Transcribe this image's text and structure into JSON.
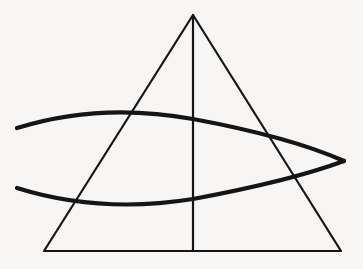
{
  "figure": {
    "type": "line-drawing",
    "background_color": "#f7f6f5",
    "ink_color": "#151515",
    "canvas": {
      "width": 363,
      "height": 269
    },
    "shapes": {
      "triangle": {
        "label": "triangle",
        "stroke_color": "#151515",
        "stroke_width": 2.2,
        "apex": {
          "x": 193,
          "y": 15
        },
        "bottom_left": {
          "x": 44,
          "y": 251
        },
        "bottom_right": {
          "x": 341,
          "y": 251
        },
        "points": "193,15 341,251 44,251"
      },
      "median_line": {
        "label": "vertical median line",
        "stroke_color": "#151515",
        "stroke_width": 2.2,
        "x1": 193,
        "y1": 15,
        "x2": 193,
        "y2": 251
      },
      "upper_arc": {
        "label": "upper arc of fish body",
        "stroke_color": "#151515",
        "stroke_width": 4.2,
        "path": "M 17 128 Q 100 102 193 119 Q 290 137 344 161",
        "start": {
          "x": 17,
          "y": 128
        },
        "end": {
          "x": 344,
          "y": 161
        },
        "apex_at_median": {
          "x": 193,
          "y": 119
        }
      },
      "lower_arc": {
        "label": "lower arc of fish body",
        "stroke_color": "#151515",
        "stroke_width": 4.2,
        "path": "M 17 188 Q 100 214 193 199 Q 290 181 344 161",
        "start": {
          "x": 17,
          "y": 188
        },
        "end": {
          "x": 344,
          "y": 161
        },
        "trough_at_median": {
          "x": 193,
          "y": 199
        }
      }
    },
    "intersections": [
      {
        "name": "fish-tail-crossing",
        "x": 42,
        "y": 157
      },
      {
        "name": "right-lens-tip",
        "x": 344,
        "y": 161
      },
      {
        "name": "upper-arc-left-side",
        "x": 118,
        "y": 126
      },
      {
        "name": "upper-arc-right-side",
        "x": 265,
        "y": 127
      },
      {
        "name": "lower-arc-left-side",
        "x": 85,
        "y": 183
      },
      {
        "name": "lower-arc-right-side",
        "x": 298,
        "y": 180
      },
      {
        "name": "upper-arc-median",
        "x": 193,
        "y": 119
      },
      {
        "name": "lower-arc-median",
        "x": 193,
        "y": 199
      }
    ]
  }
}
